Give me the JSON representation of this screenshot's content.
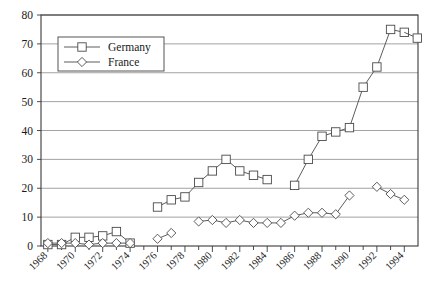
{
  "chart_data": {
    "type": "line",
    "title": "",
    "xlabel": "",
    "ylabel": "",
    "xlim": [
      1967.5,
      1995.0
    ],
    "ylim": [
      0,
      80
    ],
    "ytick_step": 10,
    "yticks": [
      0,
      10,
      20,
      30,
      40,
      50,
      60,
      70,
      80
    ],
    "xticks": [
      1968,
      1970,
      1972,
      1974,
      1976,
      1978,
      1980,
      1982,
      1984,
      1986,
      1988,
      1990,
      1992,
      1994
    ],
    "xtick_labels": [
      "1968",
      "1970",
      "1972",
      "1974",
      "1976",
      "1978",
      "1980",
      "1982",
      "1984",
      "1986",
      "1988",
      "1990",
      "1992",
      "1994"
    ],
    "ytick_labels": [
      "0",
      "10",
      "20",
      "30",
      "40",
      "50",
      "60",
      "70",
      "80"
    ],
    "grid": true,
    "grid_axis": "y",
    "legend_position": "upper-left",
    "marker_colors": {
      "line": "#4a4a4a",
      "marker_fill": "#ffffff",
      "grid": "#8a8a8a",
      "frame": "#3a3a3a"
    },
    "series": [
      {
        "name": "Germany",
        "marker": "square",
        "x": [
          1968,
          1969,
          1970,
          1971,
          1972,
          1973,
          1974,
          1976,
          1977,
          1978,
          1979,
          1980,
          1981,
          1982,
          1983,
          1984,
          1986,
          1987,
          1988,
          1989,
          1990,
          1991,
          1992,
          1993,
          1994
        ],
        "values": [
          0.5,
          0.5,
          3.0,
          3.0,
          3.5,
          5.0,
          1.0,
          13.5,
          16.0,
          17.0,
          22.0,
          26.0,
          30.0,
          26.0,
          24.5,
          23.0,
          21.0,
          30.0,
          38.0,
          39.5,
          41.0,
          55.0,
          62.0,
          75.0,
          74.0
        ]
      },
      {
        "name": "France",
        "marker": "diamond",
        "x": [
          1968,
          1969,
          1970,
          1971,
          1972,
          1973,
          1974,
          1976,
          1977,
          1979,
          1980,
          1981,
          1982,
          1983,
          1984,
          1985,
          1986,
          1987,
          1988,
          1989,
          1990,
          1992,
          1993,
          1994
        ],
        "values": [
          1.0,
          1.0,
          1.0,
          0.5,
          1.0,
          1.0,
          1.0,
          2.5,
          4.5,
          8.5,
          9.0,
          8.0,
          9.0,
          8.0,
          8.0,
          8.0,
          10.5,
          11.5,
          11.5,
          11.0,
          17.5,
          20.5,
          18.0,
          16.0
        ]
      }
    ],
    "germany_last_value": 72.0
  },
  "legend": {
    "entries": [
      {
        "label": "Germany",
        "marker": "square"
      },
      {
        "label": "France",
        "marker": "diamond"
      }
    ]
  }
}
